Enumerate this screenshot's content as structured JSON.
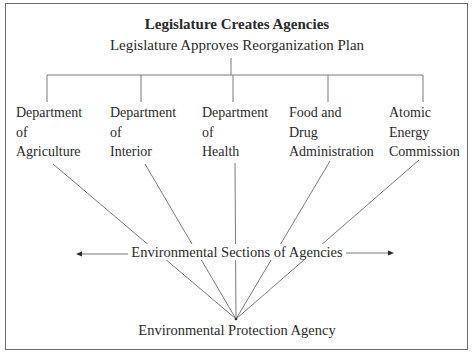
{
  "diagram": {
    "title": "Legislature Creates Agencies",
    "subtitle": "Legislature Approves Reorganization Plan",
    "departments": [
      {
        "lines": [
          "Department",
          "of",
          "Agriculture"
        ]
      },
      {
        "lines": [
          "Department",
          "of",
          "Interior"
        ]
      },
      {
        "lines": [
          "Department",
          "of",
          "Health"
        ]
      },
      {
        "lines": [
          "Food and",
          "Drug",
          "Administration"
        ]
      },
      {
        "lines": [
          "Atomic",
          "Energy",
          "Commission"
        ]
      }
    ],
    "middle_label": "Environmental Sections of Agencies",
    "bottom_label": "Environmental Protection Agency",
    "arrows": {
      "left": "left-arrow",
      "right": "right-arrow"
    },
    "colors": {
      "line": "#7a7a7a",
      "text": "#2a2a2a",
      "border": "#6a6a6a"
    }
  }
}
